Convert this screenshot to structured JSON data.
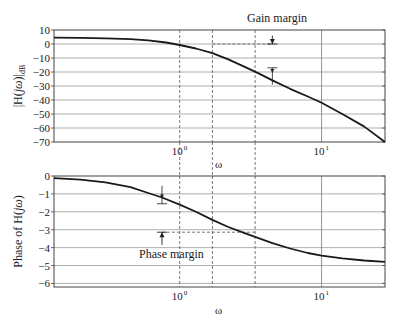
{
  "chart_data": [
    {
      "type": "line",
      "title": "",
      "xlabel": "ω",
      "ylabel": "|H(jω)|dB",
      "ylabel_main": "|H(",
      "ylabel_italic": "jω",
      "ylabel_close": ")|",
      "ylabel_sub": "dB",
      "xscale": "log",
      "xlim": [
        0.13,
        28
      ],
      "ylim": [
        -70,
        10
      ],
      "yticks": [
        10,
        0,
        -10,
        -20,
        -30,
        -40,
        -50,
        -60,
        -70
      ],
      "xticks": [
        {
          "value": 1,
          "label": "10",
          "exp": "0"
        },
        {
          "value": 10,
          "label": "10",
          "exp": "1"
        }
      ],
      "grid": true,
      "series": [
        {
          "name": "magnitude",
          "x": [
            0.13,
            0.2,
            0.3,
            0.45,
            0.6,
            0.8,
            1.0,
            1.3,
            1.7,
            2.2,
            2.9,
            3.6,
            4.5,
            6,
            8,
            10,
            14,
            20,
            28
          ],
          "y": [
            4.5,
            4.4,
            4.1,
            3.5,
            2.6,
            1.1,
            -0.7,
            -3.2,
            -6.5,
            -11,
            -16.5,
            -21,
            -26,
            -32,
            -37.5,
            -42,
            -50,
            -59,
            -70
          ]
        }
      ],
      "annotations": [
        {
          "text": "Gain margin",
          "type": "label"
        },
        {
          "type": "dashed-h",
          "y": 0,
          "x_from": 1.7,
          "x_to": 4.5
        },
        {
          "type": "arrow-down",
          "x": 4.5,
          "y_from": 6,
          "y_to": 0
        },
        {
          "type": "t-marker",
          "x": 4.5,
          "y_top": -17,
          "y_bottom": -29,
          "y_curve": -20
        },
        {
          "type": "dashed-v",
          "x": 1.0
        },
        {
          "type": "dashed-v",
          "x": 1.7
        },
        {
          "type": "dashed-v",
          "x": 3.4
        }
      ]
    },
    {
      "type": "line",
      "title": "",
      "xlabel": "ω",
      "ylabel": "Phase of H(jω)",
      "ylabel_main": "Phase of H(",
      "ylabel_italic": "jω",
      "ylabel_close": ")",
      "xscale": "log",
      "xlim": [
        0.13,
        28
      ],
      "ylim": [
        -6.2,
        0
      ],
      "yticks": [
        0,
        -1,
        -2,
        -3,
        -4,
        -5,
        -6
      ],
      "xticks": [
        {
          "value": 1,
          "label": "10",
          "exp": "0"
        },
        {
          "value": 10,
          "label": "10",
          "exp": "1"
        }
      ],
      "grid": true,
      "series": [
        {
          "name": "phase",
          "x": [
            0.13,
            0.2,
            0.3,
            0.45,
            0.6,
            0.75,
            1.0,
            1.3,
            1.7,
            2.2,
            2.9,
            3.4,
            4.5,
            6,
            8,
            10,
            14,
            20,
            28
          ],
          "y": [
            -0.12,
            -0.2,
            -0.35,
            -0.62,
            -0.95,
            -1.2,
            -1.6,
            -2.0,
            -2.45,
            -2.85,
            -3.2,
            -3.4,
            -3.75,
            -4.05,
            -4.3,
            -4.45,
            -4.6,
            -4.72,
            -4.8
          ]
        }
      ],
      "annotations": [
        {
          "text": "Phase margin",
          "type": "label"
        },
        {
          "type": "dashed-h",
          "y": -3.14,
          "x_from": 0.75,
          "x_to": 3.4
        },
        {
          "type": "arrow-up",
          "x": 0.75,
          "y_from": -3.85,
          "y_to": -3.14
        },
        {
          "type": "t-marker",
          "x": 0.75,
          "y_top": -0.55,
          "y_bottom": -1.55,
          "y_curve": -1.2
        },
        {
          "type": "dashed-v",
          "x": 1.0
        },
        {
          "type": "dashed-v",
          "x": 1.7
        },
        {
          "type": "dashed-v",
          "x": 3.4
        }
      ]
    }
  ],
  "labels": {
    "gain_margin": "Gain margin",
    "phase_margin": "Phase margin",
    "omega_top": "ω",
    "omega_bottom": "ω",
    "mag_ylabel": "|H(jω)|dB",
    "phase_ylabel": "Phase of H(jω)"
  }
}
